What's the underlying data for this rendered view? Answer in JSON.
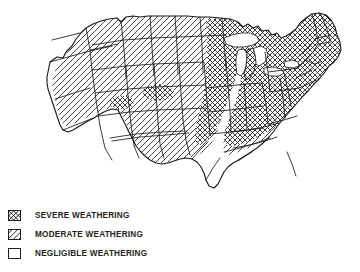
{
  "figure": {
    "background_color": "#ffffff",
    "ink_color": "#1b1b1b",
    "title": ""
  },
  "map": {
    "name": "weathering-severity-map",
    "region": "Contiguous United States",
    "outline_color": "#1b1b1b",
    "zones": [
      {
        "key": "severe",
        "label": "SEVERE WEATHERING",
        "pattern": "cross-hatch",
        "fill_color": "#ffffff",
        "hatch_color": "#1b1b1b",
        "areas": "Northeast, New England, Maine, Great Lakes states, Midwest, Appalachians, upper Mississippi valley, isolated Rocky Mountain patches in Colorado and Utah"
      },
      {
        "key": "moderate",
        "label": "MODERATE WEATHERING",
        "pattern": "diagonal-hatch",
        "fill_color": "#ffffff",
        "hatch_color": "#1b1b1b",
        "areas": "Pacific Northwest interior, Northern Rockies, Great Plains, Oklahoma panhandle, Deep South transition band"
      },
      {
        "key": "negligible",
        "label": "NEGLIGIBLE WEATHERING",
        "pattern": "blank",
        "fill_color": "#ffffff",
        "hatch_color": "none",
        "areas": "Pacific coastal strip of California and coastal Oregon and Washington, Texas, Gulf Coast, Florida"
      }
    ],
    "water_bodies": [
      {
        "name": "Great Lakes",
        "fill_color": "#ffffff"
      }
    ]
  },
  "legend": {
    "name": "map-legend",
    "position": "bottom-left",
    "items": [
      {
        "swatch": "severe-hatch-swatch",
        "label": "SEVERE WEATHERING"
      },
      {
        "swatch": "moderate-hatch-swatch",
        "label": "MODERATE WEATHERING"
      },
      {
        "swatch": "negligible-blank-swatch",
        "label": "NEGLIGIBLE WEATHERING"
      }
    ]
  }
}
